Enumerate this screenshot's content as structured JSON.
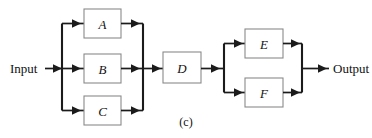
{
  "figure": {
    "caption": "(c)",
    "input_label": "Input",
    "output_label": "Output",
    "background_color": "#ffffff",
    "line_color": "#1b1b1b",
    "box_border_color": "#8a8a8a",
    "text_color": "#111111"
  },
  "blocks": [
    {
      "id": "A",
      "label": "A",
      "x": 84,
      "y": 9,
      "w": 37,
      "h": 29
    },
    {
      "id": "B",
      "label": "B",
      "x": 84,
      "y": 54,
      "w": 37,
      "h": 29
    },
    {
      "id": "C",
      "label": "C",
      "x": 84,
      "y": 96,
      "w": 37,
      "h": 29
    },
    {
      "id": "D",
      "label": "D",
      "x": 163,
      "y": 52,
      "w": 38,
      "h": 31
    },
    {
      "id": "E",
      "label": "E",
      "x": 245,
      "y": 29,
      "w": 38,
      "h": 29
    },
    {
      "id": "F",
      "label": "F",
      "x": 245,
      "y": 78,
      "w": 38,
      "h": 29
    }
  ],
  "connections": [
    {
      "from": "input",
      "to": "split-1"
    },
    {
      "from": "split-1",
      "to": "A"
    },
    {
      "from": "split-1",
      "to": "B"
    },
    {
      "from": "split-1",
      "to": "C"
    },
    {
      "from": "A",
      "to": "merge-1"
    },
    {
      "from": "B",
      "to": "merge-1"
    },
    {
      "from": "C",
      "to": "merge-1"
    },
    {
      "from": "merge-1",
      "to": "D"
    },
    {
      "from": "D",
      "to": "split-2"
    },
    {
      "from": "split-2",
      "to": "E"
    },
    {
      "from": "split-2",
      "to": "F"
    },
    {
      "from": "E",
      "to": "merge-2"
    },
    {
      "from": "F",
      "to": "merge-2"
    },
    {
      "from": "merge-2",
      "to": "output"
    }
  ],
  "structure": {
    "description": "Series-parallel block diagram: input feeds three parallel blocks A, B, C which merge into block D in series, whose output splits into two parallel blocks E and F that merge to the output."
  }
}
